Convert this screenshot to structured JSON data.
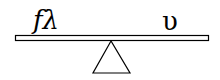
{
  "diagram": {
    "type": "seesaw",
    "left_label": "fλ",
    "right_label": "υ",
    "colors": {
      "stroke": "#000000",
      "fill": "#ffffff"
    },
    "beam": {
      "x1": 15,
      "y1": 35,
      "x2": 209,
      "y2": 41
    },
    "fulcrum": {
      "apex": [
        111,
        41
      ],
      "base_left": [
        93,
        73
      ],
      "base_right": [
        130,
        73
      ]
    }
  }
}
